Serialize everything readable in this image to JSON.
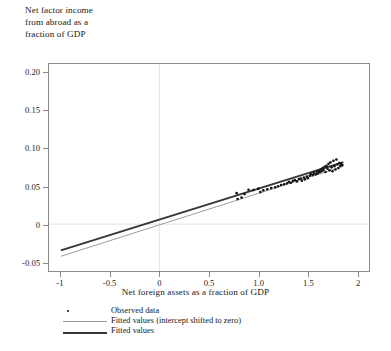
{
  "chart_data": {
    "type": "scatter",
    "title": "",
    "ylabel": "Net factor income\nfrom abroad as a\nfraction of GDP",
    "xlabel": "Net foreign assets as a fraction of GDP",
    "xlim": [
      -1.12,
      2.12
    ],
    "ylim": [
      -0.062,
      0.212
    ],
    "xticks": [
      -1,
      -0.5,
      0,
      0.5,
      1.0,
      1.5,
      2
    ],
    "xticklabels": [
      "-1",
      "-0.5",
      "0",
      "0.5",
      "1.0",
      "1.5",
      "2"
    ],
    "yticks": [
      -0.05,
      0,
      0.05,
      0.1,
      0.15,
      0.2
    ],
    "yticklabels": [
      "-0.05",
      "0",
      "0.05",
      "0.10",
      "0.15",
      "0.20"
    ],
    "grid": "reference lines at x=0 and y=0",
    "gridcolor": "#e2e2e2",
    "legend_position": "below-axes-left",
    "series": [
      {
        "name": "Observed data",
        "type": "scatter",
        "marker": "dot",
        "color": "#151515",
        "points": [
          [
            0.78,
            0.041
          ],
          [
            0.79,
            0.0332
          ],
          [
            0.83,
            0.0352
          ],
          [
            0.86,
            0.0398
          ],
          [
            0.9,
            0.0455
          ],
          [
            0.95,
            0.0452
          ],
          [
            1.0,
            0.0471
          ],
          [
            1.02,
            0.0425
          ],
          [
            1.05,
            0.0448
          ],
          [
            1.09,
            0.0462
          ],
          [
            1.13,
            0.0478
          ],
          [
            1.17,
            0.0487
          ],
          [
            1.2,
            0.0502
          ],
          [
            1.23,
            0.0518
          ],
          [
            1.26,
            0.0528
          ],
          [
            1.29,
            0.0541
          ],
          [
            1.31,
            0.056
          ],
          [
            1.33,
            0.0548
          ],
          [
            1.35,
            0.0572
          ],
          [
            1.37,
            0.0585
          ],
          [
            1.39,
            0.0566
          ],
          [
            1.41,
            0.0598
          ],
          [
            1.43,
            0.0604
          ],
          [
            1.44,
            0.0575
          ],
          [
            1.46,
            0.0618
          ],
          [
            1.47,
            0.0592
          ],
          [
            1.49,
            0.063
          ],
          [
            1.5,
            0.0609
          ],
          [
            1.52,
            0.0641
          ],
          [
            1.53,
            0.0662
          ],
          [
            1.55,
            0.065
          ],
          [
            1.56,
            0.0678
          ],
          [
            1.58,
            0.0659
          ],
          [
            1.59,
            0.0694
          ],
          [
            1.6,
            0.0671
          ],
          [
            1.61,
            0.0706
          ],
          [
            1.62,
            0.0688
          ],
          [
            1.63,
            0.0724
          ],
          [
            1.64,
            0.0702
          ],
          [
            1.65,
            0.0741
          ],
          [
            1.66,
            0.0716
          ],
          [
            1.67,
            0.0758
          ],
          [
            1.68,
            0.069
          ],
          [
            1.69,
            0.0772
          ],
          [
            1.7,
            0.0735
          ],
          [
            1.71,
            0.0798
          ],
          [
            1.72,
            0.0712
          ],
          [
            1.73,
            0.0818
          ],
          [
            1.74,
            0.0752
          ],
          [
            1.75,
            0.07
          ],
          [
            1.76,
            0.0838
          ],
          [
            1.77,
            0.0768
          ],
          [
            1.78,
            0.0724
          ],
          [
            1.79,
            0.0856
          ],
          [
            1.8,
            0.079
          ],
          [
            1.81,
            0.0742
          ],
          [
            1.82,
            0.0808
          ],
          [
            1.83,
            0.077
          ],
          [
            1.84,
            0.0795
          ],
          [
            1.85,
            0.0782
          ]
        ]
      },
      {
        "name": "Fitted values (intercept shifted to zero)",
        "type": "line",
        "color": "#9b9b9b",
        "width": 1.0,
        "x_range": [
          -1.0,
          1.86
        ],
        "y_range": [
          -0.0425,
          0.0765
        ]
      },
      {
        "name": "Fitted values",
        "type": "line",
        "color": "#363636",
        "width": 1.9,
        "x_range": [
          -1.0,
          1.86
        ],
        "y_range": [
          -0.0348,
          0.082
        ]
      }
    ],
    "legend": [
      {
        "label": "Observed data",
        "marker": "dot",
        "color": "#151515"
      },
      {
        "label": "Fitted values (intercept shifted to zero)",
        "marker": "line-thin",
        "color": "#9b9b9b"
      },
      {
        "label": "Fitted values",
        "marker": "line-thick",
        "color": "#363636"
      }
    ]
  },
  "axes": {
    "frame_color": "#8a8a8a"
  }
}
